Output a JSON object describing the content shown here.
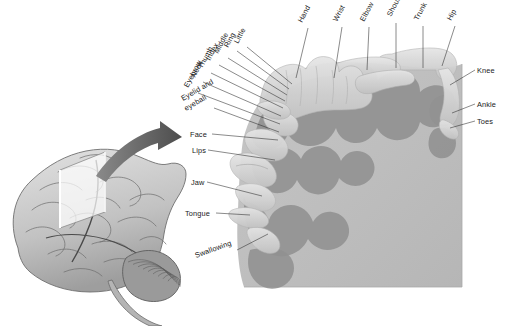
{
  "figure": {
    "background_color": "#ffffff"
  },
  "colors": {
    "cortex_block": "#bfbfbf",
    "cortex_gyri": "#919191",
    "homunculus_body": "#d8d8d8",
    "homunculus_shade": "#bcbcbc",
    "brain_light": "#d9d9d9",
    "brain_mid": "#a8a8a8",
    "brain_dark": "#6e6e6e",
    "arrow": "#6b6b6b",
    "leader_line": "#2b2b2b",
    "label_text": "#1a1a1a"
  },
  "brain_inset": {
    "name": "lateral-brain-illustration",
    "slice_plane_name": "coronal-slice-plane"
  },
  "arrow": {
    "name": "pointer-arrow",
    "direction": "right"
  },
  "labels": {
    "rotated": [
      {
        "text": "Little",
        "x": 238,
        "y": 44,
        "rotate": -62,
        "lx": 247,
        "ly": 47,
        "tx": 292,
        "ty": 84
      },
      {
        "text": "Ring",
        "x": 228,
        "y": 48,
        "rotate": -62,
        "lx": 237,
        "ly": 51,
        "tx": 289,
        "ty": 89
      },
      {
        "text": "Middle",
        "x": 218,
        "y": 54,
        "rotate": -62,
        "lx": 228,
        "ly": 58,
        "tx": 287,
        "ty": 95
      },
      {
        "text": "Index",
        "x": 210,
        "y": 61,
        "rotate": -62,
        "lx": 219,
        "ly": 65,
        "tx": 285,
        "ty": 101
      },
      {
        "text": "Thumb",
        "x": 202,
        "y": 69,
        "rotate": -62,
        "lx": 211,
        "ly": 73,
        "tx": 283,
        "ty": 108
      },
      {
        "text": "Neck",
        "x": 195,
        "y": 78,
        "rotate": -62,
        "lx": 203,
        "ly": 82,
        "tx": 281,
        "ty": 116
      },
      {
        "text": "Eyebrow",
        "x": 188,
        "y": 88,
        "rotate": -62,
        "lx": 198,
        "ly": 93,
        "tx": 280,
        "ty": 124
      },
      {
        "text": "Eyelid and",
        "x": 183,
        "y": 101,
        "rotate": -30,
        "lx": 214,
        "ly": 108,
        "tx": 279,
        "ty": 132
      },
      {
        "text": "eyeball",
        "x": 186,
        "y": 111,
        "rotate": -30,
        "lx": null,
        "ly": null,
        "tx": null,
        "ty": null
      },
      {
        "text": "Hand",
        "x": 302,
        "y": 23,
        "rotate": -62,
        "lx": 308,
        "ly": 28,
        "tx": 296,
        "ty": 78
      },
      {
        "text": "Wrist",
        "x": 337,
        "y": 22,
        "rotate": -62,
        "lx": 342,
        "ly": 27,
        "tx": 334,
        "ty": 78
      },
      {
        "text": "Elbow",
        "x": 364,
        "y": 22,
        "rotate": -62,
        "lx": 369,
        "ly": 27,
        "tx": 367,
        "ty": 70
      },
      {
        "text": "Shoulder",
        "x": 391,
        "y": 17,
        "rotate": -62,
        "lx": 396,
        "ly": 23,
        "tx": 396,
        "ty": 68
      },
      {
        "text": "Trunk",
        "x": 418,
        "y": 21,
        "rotate": -62,
        "lx": 423,
        "ly": 26,
        "tx": 423,
        "ty": 68
      },
      {
        "text": "Hip",
        "x": 451,
        "y": 21,
        "rotate": -62,
        "lx": 455,
        "ly": 26,
        "tx": 442,
        "ty": 66
      },
      {
        "text": "Face",
        "x": 190,
        "y": 137,
        "rotate": 0,
        "lx": 212,
        "ly": 134,
        "tx": 278,
        "ty": 140
      },
      {
        "text": "Lips",
        "x": 192,
        "y": 153,
        "rotate": 0,
        "lx": 208,
        "ly": 150,
        "tx": 275,
        "ty": 160
      },
      {
        "text": "Jaw",
        "x": 191,
        "y": 185,
        "rotate": 0,
        "lx": 207,
        "ly": 182,
        "tx": 262,
        "ty": 196
      },
      {
        "text": "Tongue",
        "x": 185,
        "y": 216,
        "rotate": 0,
        "lx": 216,
        "ly": 213,
        "tx": 250,
        "ty": 215
      },
      {
        "text": "Swallowing",
        "x": 196,
        "y": 258,
        "rotate": -20,
        "lx": 237,
        "ly": 250,
        "tx": 268,
        "ty": 234
      },
      {
        "text": "Knee",
        "x": 477,
        "y": 73,
        "rotate": 0,
        "lx": 475,
        "ly": 70,
        "tx": 450,
        "ty": 85
      },
      {
        "text": "Ankle",
        "x": 477,
        "y": 107,
        "rotate": 0,
        "lx": 475,
        "ly": 104,
        "tx": 452,
        "ty": 113
      },
      {
        "text": "Toes",
        "x": 477,
        "y": 124,
        "rotate": 0,
        "lx": 475,
        "ly": 121,
        "tx": 450,
        "ty": 128
      }
    ]
  },
  "label_list": [
    "Little",
    "Ring",
    "Middle",
    "Index",
    "Thumb",
    "Neck",
    "Eyebrow",
    "Eyelid and eyeball",
    "Hand",
    "Wrist",
    "Elbow",
    "Shoulder",
    "Trunk",
    "Hip",
    "Face",
    "Lips",
    "Jaw",
    "Tongue",
    "Swallowing",
    "Knee",
    "Ankle",
    "Toes"
  ]
}
